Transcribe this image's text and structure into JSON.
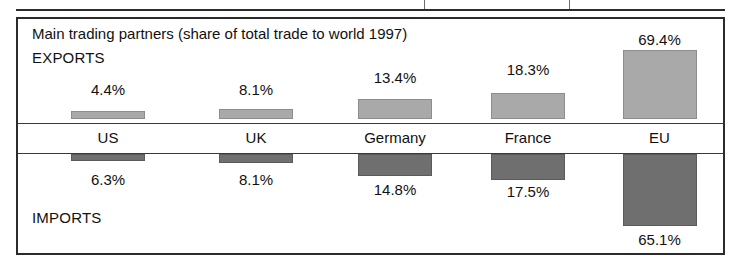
{
  "previous_table": {
    "divider_positions_px": [
      424,
      569
    ]
  },
  "chart_data": {
    "type": "bar",
    "title": "Main trading partners (share of total trade to world 1997)",
    "xlabel": "",
    "ylabel": "",
    "grid": false,
    "legend_position": "inline-left",
    "categories": [
      "US",
      "UK",
      "Germany",
      "France",
      "EU"
    ],
    "series": [
      {
        "name": "EXPORTS",
        "direction": "up",
        "color": "#a9a9a9",
        "values": [
          4.4,
          8.1,
          13.4,
          18.3,
          69.4
        ],
        "labels": [
          "4.4%",
          "8.1%",
          "13.4%",
          "18.3%",
          "69.4%"
        ]
      },
      {
        "name": "IMPORTS",
        "direction": "down",
        "color": "#6f6f6f",
        "values": [
          6.3,
          8.1,
          14.8,
          17.5,
          65.1
        ],
        "labels": [
          "6.3%",
          "8.1%",
          "14.8%",
          "17.5%",
          "65.1%"
        ]
      }
    ],
    "value_unit": "percent",
    "ylim": [
      0,
      75
    ]
  },
  "columns": [
    {
      "country": "US",
      "export_label": "4.4%",
      "import_label": "6.3%",
      "left": 14,
      "width": 152,
      "bar_width": 74,
      "export_height": 8,
      "import_height": 7,
      "export_value_top": 62,
      "import_value_top": 152
    },
    {
      "country": "UK",
      "export_label": "8.1%",
      "import_label": "8.1%",
      "left": 166,
      "width": 144,
      "bar_width": 74,
      "export_height": 10,
      "import_height": 9,
      "export_value_top": 62,
      "import_value_top": 152
    },
    {
      "country": "Germany",
      "export_label": "13.4%",
      "import_label": "14.8%",
      "left": 310,
      "width": 134,
      "bar_width": 74,
      "export_height": 20,
      "import_height": 22,
      "export_value_top": 50,
      "import_value_top": 162
    },
    {
      "country": "France",
      "export_label": "18.3%",
      "import_label": "17.5%",
      "left": 444,
      "width": 132,
      "bar_width": 74,
      "export_height": 26,
      "import_height": 26,
      "export_value_top": 42,
      "import_value_top": 164
    },
    {
      "country": "EU",
      "export_label": "69.4%",
      "import_label": "65.1%",
      "left": 576,
      "width": 131,
      "bar_width": 74,
      "export_height": 69,
      "import_height": 72,
      "export_value_top": 12,
      "import_value_top": 212
    }
  ],
  "labels": {
    "exports_heading": "EXPORTS",
    "imports_heading": "IMPORTS"
  }
}
